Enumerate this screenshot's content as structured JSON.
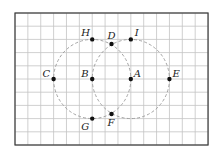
{
  "diagram": {
    "type": "geometry-grid",
    "grid": {
      "columns": 15,
      "rows": 10,
      "origin_px": [
        15,
        13
      ],
      "cell_w_px": 12.87,
      "cell_h_px": 13.2,
      "line_color": "#c4c4c4",
      "border_color": "#3a3a3a"
    },
    "circles": [
      {
        "name": "circle-centered-B",
        "center": "B",
        "radius_cells": 3,
        "style": "dashed"
      },
      {
        "name": "circle-centered-A",
        "center": "A",
        "radius_cells": 3,
        "style": "dashed"
      }
    ],
    "points": [
      {
        "label": "A",
        "gx": 9,
        "gy": 5,
        "lx": 3,
        "ly": -2
      },
      {
        "label": "B",
        "gx": 6,
        "gy": 5,
        "lx": -11,
        "ly": -2
      },
      {
        "label": "C",
        "gx": 3,
        "gy": 5,
        "lx": -11,
        "ly": -2
      },
      {
        "label": "D",
        "gx": 7.5,
        "gy": 2.35,
        "lx": -4,
        "ly": -5
      },
      {
        "label": "E",
        "gx": 12,
        "gy": 5,
        "lx": 3,
        "ly": -2
      },
      {
        "label": "F",
        "gx": 7.5,
        "gy": 7.65,
        "lx": -4,
        "ly": 12
      },
      {
        "label": "G",
        "gx": 6,
        "gy": 8,
        "lx": -11,
        "ly": 11
      },
      {
        "label": "H",
        "gx": 6,
        "gy": 2,
        "lx": -11,
        "ly": -3
      },
      {
        "label": "I",
        "gx": 9,
        "gy": 2,
        "lx": 4,
        "ly": -3
      }
    ]
  }
}
